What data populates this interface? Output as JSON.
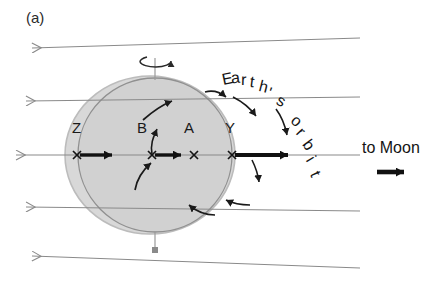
{
  "figure": {
    "panel_label": "(a)",
    "type": "diagram"
  },
  "labels": {
    "point_z": "Z",
    "point_b": "B",
    "point_a": "A",
    "point_y": "Y",
    "to_moon": "to Moon",
    "earths_orbit": "Earth's orbit"
  },
  "colors": {
    "bulge_fill": "#d6d6d6",
    "bulge_stroke": "#b4b4b4",
    "earth_fill": "#cfcfcf",
    "earth_stroke": "#8e8e8e",
    "field_line": "#8a8a8a",
    "arrow_dark": "#1a1a1a",
    "text": "#1a1a1a",
    "background": "#ffffff"
  },
  "geometry": {
    "canvas_width": 444,
    "canvas_height": 282,
    "earth_center_x": 155,
    "earth_center_y": 155,
    "earth_radius": 77,
    "bulge_center_x": 150,
    "bulge_center_y": 155,
    "bulge_rx": 85,
    "bulge_ry": 79,
    "axis_tick_top_y": 58,
    "axis_tick_bottom_y": 250
  },
  "points": [
    {
      "name": "Z",
      "x": 77,
      "y": 155,
      "marker": "cross",
      "has_vector": true,
      "vector": "right"
    },
    {
      "name": "B",
      "x": 152,
      "y": 155,
      "marker": "cross",
      "has_vector": true,
      "vector": "right-and-up"
    },
    {
      "name": "A",
      "x": 194,
      "y": 155,
      "marker": "cross",
      "has_vector": false,
      "vector": "none"
    },
    {
      "name": "Y",
      "x": 232,
      "y": 155,
      "marker": "cross",
      "has_vector": true,
      "vector": "right"
    }
  ],
  "field_lines": {
    "count": 5,
    "direction": "left-pointing arrowheads converging toward the right",
    "left_arrow_y": [
      50,
      100,
      155,
      208,
      255
    ],
    "convergence_x": 360
  },
  "annotations": {
    "spin_axis": "rotation axis with circular spin arrow at north pole",
    "tidal_arrows": "curved arrows around Earth indicating tidal flow",
    "orbit_arrows": "two short arrows pointing down-right along Earth's orbit"
  }
}
